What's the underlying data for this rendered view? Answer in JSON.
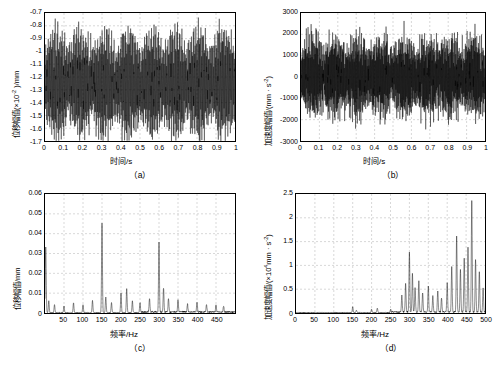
{
  "figure": {
    "background": "#ffffff",
    "line_color": "#000000",
    "grid_color": "#b0b0b0"
  },
  "captions": {
    "a": "（a）",
    "b": "（b）",
    "c": "（c）",
    "d": "（d）"
  },
  "chart_data": [
    {
      "id": "a",
      "type": "line",
      "title": "",
      "xlabel": "时间/s",
      "ylabel": "位移幅值(×10⁻² )/mm",
      "ylabel_parts": {
        "text": "位移幅值(×10",
        "exp": "-2",
        "unit": ")/mm"
      },
      "xlim": [
        0,
        1
      ],
      "ylim": [
        -1.7,
        -0.7
      ],
      "xticks": [
        0,
        0.1,
        0.2,
        0.3,
        0.4,
        0.5,
        0.6,
        0.7,
        0.8,
        0.9,
        1
      ],
      "xticklabels": [
        "0",
        "0.1",
        "0.2",
        "0.3",
        "0.4",
        "0.5",
        "0.6",
        "0.7",
        "0.8",
        "0.9",
        "1"
      ],
      "yticks": [
        -1.7,
        -1.6,
        -1.5,
        -1.4,
        -1.3,
        -1.2,
        -1.1,
        -1.0,
        -0.9,
        -0.8,
        -0.7
      ],
      "yticklabels": [
        "-1.7",
        "-1.6",
        "-1.5",
        "-1.4",
        "-1.3",
        "-1.2",
        "-1.1",
        "-1",
        "-0.9",
        "-0.8",
        "-0.7"
      ],
      "grid": true,
      "description": "Dense oscillating time-domain displacement signal centered near -1.25, envelope modulated with about 8 beats per second, amplitude band roughly -1.65 to -0.95",
      "signal": {
        "mean": -1.25,
        "carrier_hz": 300,
        "beat_hz": 8,
        "amp_base": 0.18,
        "amp_mod": 0.12,
        "noise": 0.06
      }
    },
    {
      "id": "b",
      "type": "line",
      "title": "",
      "xlabel": "时间/s",
      "ylabel": "加速度幅值/(mm · s⁻²)",
      "ylabel_parts": {
        "text": "加速度幅值/(mm · s",
        "exp": "-2",
        "unit": ")"
      },
      "xlim": [
        0,
        1
      ],
      "ylim": [
        -3000,
        3000
      ],
      "xticks": [
        0,
        0.1,
        0.2,
        0.3,
        0.4,
        0.5,
        0.6,
        0.7,
        0.8,
        0.9,
        1
      ],
      "xticklabels": [
        "0",
        "0.1",
        "0.2",
        "0.3",
        "0.4",
        "0.5",
        "0.6",
        "0.7",
        "0.8",
        "0.9",
        "1"
      ],
      "yticks": [
        -3000,
        -2000,
        -1000,
        0,
        1000,
        2000,
        3000
      ],
      "yticklabels": [
        "-3000",
        "-2000",
        "-1000",
        "0",
        "1000",
        "2000",
        "3000"
      ],
      "grid": true,
      "description": "Broadband noisy acceleration signal about zero, peak amplitudes near ±2200 with occasional spikes to ±2600",
      "signal": {
        "mean": 0,
        "carrier_hz": 420,
        "beat_hz": 8,
        "amp_base": 900,
        "amp_mod": 450,
        "noise": 420
      }
    },
    {
      "id": "c",
      "type": "line",
      "title": "",
      "xlabel": "频率/Hz",
      "ylabel": "位移幅值/mm",
      "xlim": [
        0,
        500
      ],
      "ylim": [
        0,
        0.06
      ],
      "xticks": [
        0,
        50,
        100,
        150,
        200,
        250,
        300,
        350,
        400,
        450,
        500
      ],
      "xticklabels": [
        "",
        "50",
        "100",
        "150",
        "200",
        "250",
        "300",
        "350",
        "400",
        "450",
        ""
      ],
      "yticks": [
        0,
        0.01,
        0.02,
        0.03,
        0.04,
        0.05,
        0.06
      ],
      "yticklabels": [
        "0",
        "0.01",
        "0.02",
        "0.03",
        "0.04",
        "0.05",
        "0.06"
      ],
      "grid": true,
      "description": "Displacement spectrum with dominant peak near 0 Hz (0.033), strong peak at 150 Hz (0.045), and peak at 300 Hz (0.035) plus minor harmonics",
      "peaks": [
        {
          "freq": 2,
          "amp": 0.033
        },
        {
          "freq": 10,
          "amp": 0.006
        },
        {
          "freq": 25,
          "amp": 0.004
        },
        {
          "freq": 50,
          "amp": 0.0035
        },
        {
          "freq": 75,
          "amp": 0.005
        },
        {
          "freq": 100,
          "amp": 0.004
        },
        {
          "freq": 125,
          "amp": 0.006
        },
        {
          "freq": 150,
          "amp": 0.045
        },
        {
          "freq": 160,
          "amp": 0.008
        },
        {
          "freq": 175,
          "amp": 0.005
        },
        {
          "freq": 200,
          "amp": 0.01
        },
        {
          "freq": 215,
          "amp": 0.012
        },
        {
          "freq": 230,
          "amp": 0.006
        },
        {
          "freq": 250,
          "amp": 0.005
        },
        {
          "freq": 275,
          "amp": 0.007
        },
        {
          "freq": 300,
          "amp": 0.035
        },
        {
          "freq": 312,
          "amp": 0.012
        },
        {
          "freq": 325,
          "amp": 0.007
        },
        {
          "freq": 350,
          "amp": 0.006
        },
        {
          "freq": 375,
          "amp": 0.004
        },
        {
          "freq": 400,
          "amp": 0.005
        },
        {
          "freq": 425,
          "amp": 0.004
        },
        {
          "freq": 450,
          "amp": 0.0035
        },
        {
          "freq": 470,
          "amp": 0.003
        }
      ]
    },
    {
      "id": "d",
      "type": "line",
      "title": "",
      "xlabel": "频率/Hz",
      "ylabel": "加速度幅值/(×10⁴mm · s⁻²)",
      "ylabel_parts": {
        "text": "加速度幅值/(×10",
        "exp": "4",
        "mid": "mm · s",
        "exp2": "-2",
        "unit": ")"
      },
      "xlim": [
        0,
        500
      ],
      "ylim": [
        0,
        2.5
      ],
      "xticks": [
        0,
        50,
        100,
        150,
        200,
        250,
        300,
        350,
        400,
        450,
        500
      ],
      "xticklabels": [
        "0",
        "50",
        "100",
        "150",
        "200",
        "250",
        "300",
        "350",
        "400",
        "450",
        "500"
      ],
      "yticks": [
        0,
        0.5,
        1,
        1.5,
        2,
        2.5
      ],
      "yticklabels": [
        "0",
        "0.5",
        "1",
        "1.5",
        "2",
        "2.5"
      ],
      "grid": true,
      "description": "Acceleration spectrum dominated by high-frequency content: cluster of peaks from 280-500 Hz, tallest peak 2.35 near 465 Hz, secondary peaks near 300 Hz (1.25) and 430 Hz (1.6); very small content below 250 Hz",
      "peaks": [
        {
          "freq": 150,
          "amp": 0.12
        },
        {
          "freq": 160,
          "amp": 0.05
        },
        {
          "freq": 200,
          "amp": 0.07
        },
        {
          "freq": 215,
          "amp": 0.1
        },
        {
          "freq": 250,
          "amp": 0.06
        },
        {
          "freq": 280,
          "amp": 0.35
        },
        {
          "freq": 290,
          "amp": 0.6
        },
        {
          "freq": 300,
          "amp": 1.25
        },
        {
          "freq": 308,
          "amp": 0.8
        },
        {
          "freq": 315,
          "amp": 0.5
        },
        {
          "freq": 325,
          "amp": 0.65
        },
        {
          "freq": 335,
          "amp": 0.4
        },
        {
          "freq": 350,
          "amp": 0.55
        },
        {
          "freq": 362,
          "amp": 0.35
        },
        {
          "freq": 375,
          "amp": 0.45
        },
        {
          "freq": 385,
          "amp": 0.3
        },
        {
          "freq": 400,
          "amp": 0.6
        },
        {
          "freq": 412,
          "amp": 0.95
        },
        {
          "freq": 425,
          "amp": 1.6
        },
        {
          "freq": 435,
          "amp": 0.9
        },
        {
          "freq": 445,
          "amp": 1.15
        },
        {
          "freq": 455,
          "amp": 1.35
        },
        {
          "freq": 465,
          "amp": 2.35
        },
        {
          "freq": 475,
          "amp": 1.1
        },
        {
          "freq": 485,
          "amp": 0.85
        },
        {
          "freq": 495,
          "amp": 0.5
        }
      ]
    }
  ]
}
